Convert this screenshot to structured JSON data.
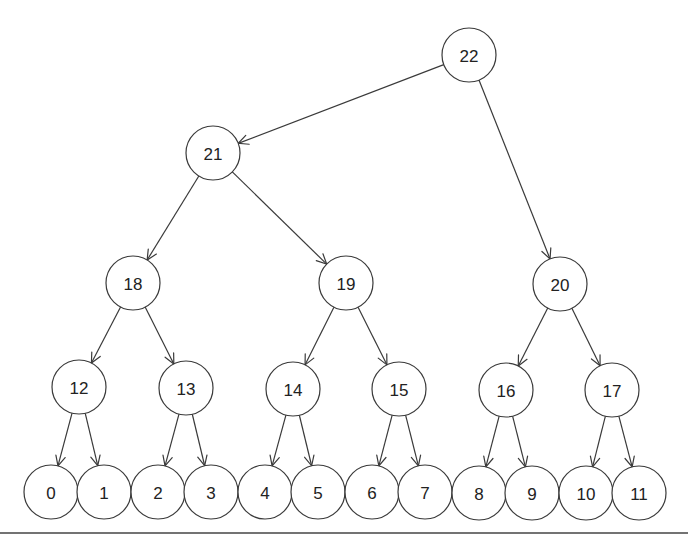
{
  "diagram": {
    "type": "tree",
    "style": {
      "stroke": "#3a3a3a",
      "fill": "#ffffff",
      "text": "#222222",
      "node_radius": 27
    },
    "nodes": [
      {
        "id": "22",
        "label": "22",
        "x": 469,
        "y": 55
      },
      {
        "id": "21",
        "label": "21",
        "x": 213,
        "y": 153
      },
      {
        "id": "18",
        "label": "18",
        "x": 133,
        "y": 283
      },
      {
        "id": "19",
        "label": "19",
        "x": 346,
        "y": 283
      },
      {
        "id": "20",
        "label": "20",
        "x": 560,
        "y": 284
      },
      {
        "id": "12",
        "label": "12",
        "x": 79,
        "y": 387
      },
      {
        "id": "13",
        "label": "13",
        "x": 186,
        "y": 388
      },
      {
        "id": "14",
        "label": "14",
        "x": 293,
        "y": 389
      },
      {
        "id": "15",
        "label": "15",
        "x": 399,
        "y": 389
      },
      {
        "id": "16",
        "label": "16",
        "x": 506,
        "y": 390
      },
      {
        "id": "17",
        "label": "17",
        "x": 612,
        "y": 390
      },
      {
        "id": "0",
        "label": "0",
        "x": 51,
        "y": 492
      },
      {
        "id": "1",
        "label": "1",
        "x": 104,
        "y": 492
      },
      {
        "id": "2",
        "label": "2",
        "x": 158,
        "y": 492
      },
      {
        "id": "3",
        "label": "3",
        "x": 211,
        "y": 492
      },
      {
        "id": "4",
        "label": "4",
        "x": 265,
        "y": 492
      },
      {
        "id": "5",
        "label": "5",
        "x": 318,
        "y": 492
      },
      {
        "id": "6",
        "label": "6",
        "x": 372,
        "y": 492
      },
      {
        "id": "7",
        "label": "7",
        "x": 425,
        "y": 492
      },
      {
        "id": "8",
        "label": "8",
        "x": 479,
        "y": 493
      },
      {
        "id": "9",
        "label": "9",
        "x": 532,
        "y": 493
      },
      {
        "id": "10",
        "label": "10",
        "x": 586,
        "y": 493
      },
      {
        "id": "11",
        "label": "11",
        "x": 639,
        "y": 493
      }
    ],
    "edges": [
      {
        "from": "22",
        "to": "21"
      },
      {
        "from": "22",
        "to": "20"
      },
      {
        "from": "21",
        "to": "18"
      },
      {
        "from": "21",
        "to": "19"
      },
      {
        "from": "18",
        "to": "12"
      },
      {
        "from": "18",
        "to": "13"
      },
      {
        "from": "19",
        "to": "14"
      },
      {
        "from": "19",
        "to": "15"
      },
      {
        "from": "20",
        "to": "16"
      },
      {
        "from": "20",
        "to": "17"
      },
      {
        "from": "12",
        "to": "0"
      },
      {
        "from": "12",
        "to": "1"
      },
      {
        "from": "13",
        "to": "2"
      },
      {
        "from": "13",
        "to": "3"
      },
      {
        "from": "14",
        "to": "4"
      },
      {
        "from": "14",
        "to": "5"
      },
      {
        "from": "15",
        "to": "6"
      },
      {
        "from": "15",
        "to": "7"
      },
      {
        "from": "16",
        "to": "8"
      },
      {
        "from": "16",
        "to": "9"
      },
      {
        "from": "17",
        "to": "10"
      },
      {
        "from": "17",
        "to": "11"
      }
    ],
    "baseline": {
      "x1": 0,
      "x2": 688,
      "y": 533
    }
  }
}
